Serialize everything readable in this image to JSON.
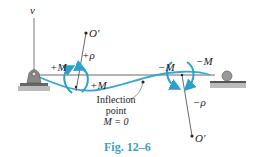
{
  "figure": {
    "caption": "Fig. 12–6",
    "labels": {
      "v_axis": "v",
      "center_top": "O′",
      "center_bottom": "O′",
      "rho_pos": "+ρ",
      "rho_neg": "−ρ",
      "moment_pos_left": "+M",
      "moment_pos_right": "+M",
      "moment_neg_left": "−M",
      "moment_neg_right": "−M"
    },
    "inflection": {
      "line1": "Inflection",
      "line2": "point",
      "line3": "M = 0"
    },
    "colors": {
      "curve": "#3aa6d0",
      "arrow": "#2aa0cf",
      "caption": "#3d9fc6",
      "line": "#333333",
      "support": "#8a8a8a"
    }
  }
}
